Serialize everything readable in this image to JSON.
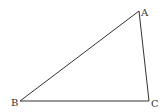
{
  "diagram": {
    "type": "triangle",
    "stroke_color": "#333333",
    "background": "#ffffff",
    "vertices": [
      {
        "name": "A",
        "x": 139,
        "y": 11,
        "label_x": 141,
        "label_y": 16
      },
      {
        "name": "B",
        "x": 20,
        "y": 101,
        "label_x": 11,
        "label_y": 106
      },
      {
        "name": "C",
        "x": 149,
        "y": 101,
        "label_x": 151,
        "label_y": 107
      }
    ],
    "edges": [
      {
        "from": "A",
        "to": "B"
      },
      {
        "from": "B",
        "to": "C"
      },
      {
        "from": "C",
        "to": "A"
      }
    ]
  }
}
